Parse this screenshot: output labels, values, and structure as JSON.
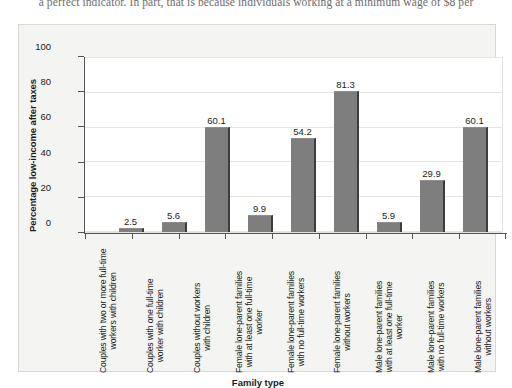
{
  "page": {
    "body_text_line": "a perfect indicator. In part, that is because individuals working at a minimum wage of $8 per"
  },
  "chart_data": {
    "type": "bar",
    "title": "",
    "xlabel": "Family type",
    "ylabel": "Percentage low-income after taxes",
    "ylim": [
      0,
      100
    ],
    "yticks": [
      0,
      20,
      40,
      60,
      80,
      100
    ],
    "grid": true,
    "legend": "none",
    "bar_color": "#7e7e7e",
    "categories": [
      "Couples with two or more full-time workers with children",
      "Couples with one full-time worker with children",
      "Couples without workers with children",
      "Female lone-parent families with at least one full-time worker",
      "Female lone-parent families with no full-time workers",
      "Female lone-parent families without workers",
      "Male lone-parent families with at least one full-time worker",
      "Male lone-parent families with no full-time workers",
      "Male lone-parent families without workers"
    ],
    "category_lines": [
      [
        "Couples with two or more full-time",
        "workers with children"
      ],
      [
        "Couples with one full-time",
        "worker with children"
      ],
      [
        "Couples without workers",
        "with children"
      ],
      [
        "Female lone-parent families",
        "with at least one full-time",
        "worker"
      ],
      [
        "Female lone-parent families",
        "with no full-time workers"
      ],
      [
        "Female lone-parent families",
        "without workers"
      ],
      [
        "Male lone-parent families",
        "with at least one full-time",
        "worker"
      ],
      [
        "Male lone-parent families",
        "with no full-time workers"
      ],
      [
        "Male lone-parent families",
        "without workers"
      ]
    ],
    "values": [
      2.5,
      5.6,
      60.1,
      9.9,
      54.2,
      81.3,
      5.9,
      29.9,
      60.1
    ],
    "value_labels": [
      "2.5",
      "5.6",
      "60.1",
      "9.9",
      "54.2",
      "81.3",
      "5.9",
      "29.9",
      "60.1"
    ]
  }
}
